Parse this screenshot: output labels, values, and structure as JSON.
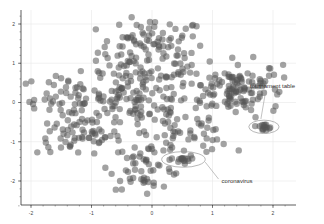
{
  "chart_data": {
    "type": "scatter",
    "title": "",
    "xlabel": "",
    "ylabel": "",
    "xlim": [
      -2.2,
      2.3
    ],
    "ylim": [
      -2.5,
      2.3
    ],
    "x_ticks": [
      -2,
      -1,
      0,
      1,
      2
    ],
    "y_ticks": [
      2,
      1,
      0,
      -1,
      -2
    ],
    "x_tick_labels": [
      "-2",
      "-1",
      "0",
      "1",
      "2"
    ],
    "y_tick_labels": [
      "2",
      "1",
      "0",
      "-1",
      "-2"
    ],
    "grid": true,
    "legend": null,
    "marker_color": "#555555",
    "marker_opacity": 0.55,
    "clusters": [
      {
        "name": "upper-center",
        "cx": 0.0,
        "cy": 1.3,
        "sx": 0.45,
        "sy": 0.45,
        "n": 110
      },
      {
        "name": "right-dense",
        "cx": 1.35,
        "cy": 0.35,
        "sx": 0.4,
        "sy": 0.35,
        "n": 130
      },
      {
        "name": "left-mid",
        "cx": -1.3,
        "cy": 0.1,
        "sx": 0.45,
        "sy": 0.3,
        "n": 70
      },
      {
        "name": "left-lower",
        "cx": -1.2,
        "cy": -0.9,
        "sx": 0.35,
        "sy": 0.2,
        "n": 45
      },
      {
        "name": "center-mid",
        "cx": -0.2,
        "cy": 0.0,
        "sx": 0.45,
        "sy": 0.5,
        "n": 110
      },
      {
        "name": "lower-center",
        "cx": -0.1,
        "cy": -1.6,
        "sx": 0.3,
        "sy": 0.3,
        "n": 55
      },
      {
        "name": "lower-right-band",
        "cx": 0.6,
        "cy": -0.8,
        "sx": 0.35,
        "sy": 0.25,
        "n": 40
      },
      {
        "name": "coronavirus",
        "cx": 0.5,
        "cy": -1.45,
        "sx": 0.07,
        "sy": 0.05,
        "n": 14
      },
      {
        "name": "tournament table",
        "cx": 1.85,
        "cy": -0.65,
        "sx": 0.07,
        "sy": 0.05,
        "n": 14
      }
    ],
    "annotations": [
      {
        "text": "tournament table",
        "ellipse": {
          "cx": 1.85,
          "cy": -0.62,
          "rx": 0.25,
          "ry": 0.17
        },
        "label_x": 1.62,
        "label_y": 0.38,
        "arrow_from": [
          1.88,
          0.3
        ],
        "arrow_to": [
          1.8,
          -0.42
        ]
      },
      {
        "text": "coronavirus",
        "ellipse": {
          "cx": 0.52,
          "cy": -1.45,
          "rx": 0.36,
          "ry": 0.2
        },
        "label_x": 1.15,
        "label_y": -2.05,
        "arrow_from": [
          1.1,
          -1.95
        ],
        "arrow_to": [
          0.88,
          -1.52
        ]
      }
    ]
  }
}
